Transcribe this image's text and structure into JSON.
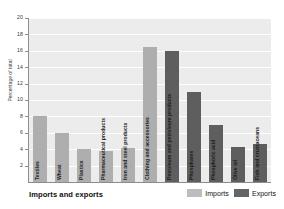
{
  "chart_data": {
    "type": "bar",
    "title": "Imports and exports",
    "xlabel": "",
    "ylabel": "Percentage of total",
    "ylim": [
      0,
      20
    ],
    "yticks": [
      20,
      18,
      16,
      14,
      12,
      10,
      8,
      6,
      4,
      2
    ],
    "grid": true,
    "legend_position": "bottom-right",
    "categories": [
      "Textiles",
      "Wheat",
      "Plastics",
      "Pharmaceutical products",
      "Iron and steel products",
      "Clothing and accessories",
      "Petroleum and petroleum products",
      "Phosphates",
      "Phosphoric acid",
      "Olive oil",
      "Fish and crustaceans"
    ],
    "series": [
      {
        "name": "Imports",
        "color": "#aeaeae",
        "values": [
          8.0,
          6.0,
          4.0,
          3.8,
          4.2,
          16.5,
          0,
          0,
          0,
          0,
          0
        ]
      },
      {
        "name": "Exports",
        "color": "#5e5e5e",
        "values": [
          0,
          0,
          0,
          0,
          0,
          0,
          16.0,
          11.0,
          7.0,
          4.3,
          4.6
        ]
      }
    ]
  },
  "legend": {
    "items": [
      {
        "label": "Imports",
        "color": "#bdbdbd"
      },
      {
        "label": "Exports",
        "color": "#656565"
      }
    ]
  }
}
